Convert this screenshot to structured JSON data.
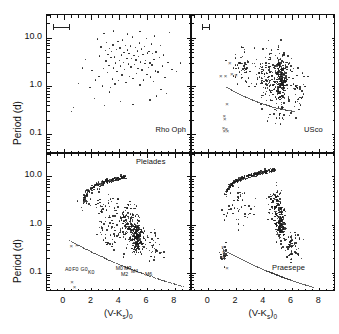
{
  "figure": {
    "axis_titles": {
      "y": "Period (d)",
      "x_html": "(V-K",
      "x_sub": "s",
      "x_tail": ")",
      "x_sub2": "0"
    },
    "y_ticklabels": [
      "10.0",
      "1.0",
      "0.1"
    ],
    "x_ticklabels": [
      "0",
      "2",
      "4",
      "6",
      "8"
    ]
  },
  "chart_data": {
    "type": "scatter",
    "title": "",
    "xlabel": "(V-Ks)0",
    "ylabel": "Period (d)",
    "xlim": [
      -1.2,
      9.2
    ],
    "ylim_log": [
      0.04,
      30
    ],
    "yscale": "log",
    "grid": false,
    "legend": "none",
    "panels": [
      {
        "name": "Rho Oph",
        "label": "Rho Oph",
        "label_pos": [
          6.6,
          0.115
        ],
        "errorbar": {
          "x_center": -0.15,
          "x_halfwidth": 0.62,
          "y": 17.0
        },
        "n_points": 112,
        "points": [
          [
            1.05,
            1.15
          ],
          [
            0.72,
            0.36
          ],
          [
            0.55,
            0.3
          ],
          [
            1.55,
            3.6
          ],
          [
            1.9,
            0.95
          ],
          [
            2.05,
            2.1
          ],
          [
            2.2,
            0.55
          ],
          [
            2.45,
            9.5
          ],
          [
            2.55,
            1.6
          ],
          [
            2.6,
            4.2
          ],
          [
            2.7,
            6.5
          ],
          [
            2.8,
            1.0
          ],
          [
            2.85,
            2.3
          ],
          [
            2.9,
            12.5
          ],
          [
            3.0,
            5.5
          ],
          [
            3.05,
            3.3
          ],
          [
            3.1,
            8.0
          ],
          [
            3.15,
            1.9
          ],
          [
            3.2,
            4.6
          ],
          [
            3.25,
            2.7
          ],
          [
            3.3,
            6.0
          ],
          [
            3.35,
            0.95
          ],
          [
            3.4,
            3.9
          ],
          [
            3.45,
            5.2
          ],
          [
            3.5,
            1.4
          ],
          [
            3.55,
            7.2
          ],
          [
            3.6,
            2.4
          ],
          [
            3.65,
            4.0
          ],
          [
            3.7,
            1.1
          ],
          [
            3.75,
            3.0
          ],
          [
            3.8,
            5.8
          ],
          [
            3.85,
            2.0
          ],
          [
            3.9,
            8.5
          ],
          [
            3.95,
            1.3
          ],
          [
            4.0,
            3.4
          ],
          [
            4.05,
            6.2
          ],
          [
            4.1,
            2.6
          ],
          [
            4.15,
            4.4
          ],
          [
            4.2,
            1.7
          ],
          [
            4.25,
            9.0
          ],
          [
            4.3,
            3.1
          ],
          [
            4.35,
            5.0
          ],
          [
            4.4,
            2.2
          ],
          [
            4.45,
            7.0
          ],
          [
            4.5,
            1.2
          ],
          [
            4.55,
            3.7
          ],
          [
            4.6,
            5.6
          ],
          [
            4.65,
            2.9
          ],
          [
            4.7,
            4.8
          ],
          [
            4.75,
            1.6
          ],
          [
            4.8,
            6.8
          ],
          [
            4.85,
            2.5
          ],
          [
            4.9,
            3.8
          ],
          [
            4.95,
            10.5
          ],
          [
            5.0,
            1.45
          ],
          [
            5.05,
            4.3
          ],
          [
            5.1,
            2.8
          ],
          [
            5.15,
            6.4
          ],
          [
            5.2,
            3.5
          ],
          [
            5.25,
            1.85
          ],
          [
            5.3,
            5.4
          ],
          [
            5.35,
            2.35
          ],
          [
            5.4,
            4.1
          ],
          [
            5.45,
            7.8
          ],
          [
            5.5,
            1.05
          ],
          [
            5.55,
            3.2
          ],
          [
            5.6,
            5.9
          ],
          [
            5.65,
            2.15
          ],
          [
            5.7,
            4.5
          ],
          [
            5.75,
            1.35
          ],
          [
            5.8,
            6.6
          ],
          [
            5.85,
            2.95
          ],
          [
            5.9,
            3.45
          ],
          [
            5.95,
            9.8
          ],
          [
            6.0,
            1.75
          ],
          [
            6.05,
            4.9
          ],
          [
            6.1,
            2.45
          ],
          [
            6.15,
            5.3
          ],
          [
            6.2,
            3.05
          ],
          [
            6.25,
            1.55
          ],
          [
            6.3,
            7.5
          ],
          [
            6.35,
            2.75
          ],
          [
            6.4,
            4.7
          ],
          [
            6.45,
            1.25
          ],
          [
            6.5,
            3.55
          ],
          [
            6.55,
            11.0
          ],
          [
            6.6,
            2.05
          ],
          [
            6.65,
            5.1
          ],
          [
            6.7,
            0.62
          ],
          [
            6.8,
            1.95
          ],
          [
            6.9,
            3.9
          ],
          [
            7.0,
            0.85
          ],
          [
            7.1,
            2.6
          ],
          [
            7.2,
            4.4
          ],
          [
            7.3,
            1.5
          ],
          [
            7.4,
            0.7
          ],
          [
            7.5,
            3.1
          ],
          [
            7.6,
            13.0
          ],
          [
            4.1,
            0.48
          ],
          [
            5.0,
            0.42
          ],
          [
            3.3,
            0.75
          ],
          [
            2.3,
            1.35
          ],
          [
            1.35,
            2.4
          ],
          [
            6.2,
            0.52
          ],
          [
            7.8,
            2.2
          ],
          [
            3.6,
            14.0
          ],
          [
            4.6,
            12.0
          ],
          [
            5.5,
            13.5
          ],
          [
            2.95,
            0.4
          ],
          [
            6.95,
            6.9
          ],
          [
            8.1,
            2.0
          ],
          [
            8.4,
            3.0
          ]
        ]
      },
      {
        "name": "USco",
        "label": "USco",
        "label_pos": [
          6.9,
          0.115
        ],
        "errorbar": {
          "x_center": -0.15,
          "x_halfwidth": 0.28,
          "y": 17.0
        },
        "n_points": 430,
        "dashed_curve": true
      },
      {
        "name": "Pleiades",
        "label": "Pleiades",
        "label_pos": [
          5.2,
          19.0
        ],
        "n_points": 520,
        "dashed_curve": true,
        "spectral_labels": [
          {
            "text": "A0",
            "x": 0.1,
            "y": 0.115
          },
          {
            "text": "F0",
            "x": 0.62,
            "y": 0.115
          },
          {
            "text": "G0",
            "x": 1.22,
            "y": 0.115
          },
          {
            "text": "K0",
            "x": 1.75,
            "y": 0.098
          },
          {
            "text": "M0",
            "x": 3.75,
            "y": 0.118
          },
          {
            "text": "M2",
            "x": 4.12,
            "y": 0.092
          },
          {
            "text": "M3",
            "x": 4.35,
            "y": 0.12
          },
          {
            "text": "M4",
            "x": 4.85,
            "y": 0.103
          },
          {
            "text": "M6",
            "x": 5.85,
            "y": 0.09
          }
        ]
      },
      {
        "name": "Praesepe",
        "label": "Praesepe",
        "label_pos": [
          4.6,
          0.118
        ],
        "n_points": 480,
        "dashed_curve": true
      }
    ]
  }
}
